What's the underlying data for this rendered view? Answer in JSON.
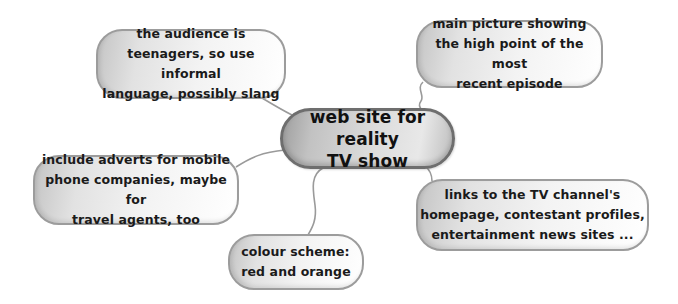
{
  "mindmap": {
    "center": {
      "label": "web site for reality\nTV show"
    },
    "branches": [
      {
        "id": "audience",
        "label": "the audience is\nteenagers, so use informal\nlanguage, possibly slang"
      },
      {
        "id": "picture",
        "label": "main picture showing\nthe high point of the most\nrecent episode"
      },
      {
        "id": "adverts",
        "label": "include adverts for mobile\nphone companies, maybe for\ntravel agents, too"
      },
      {
        "id": "links",
        "label": "links to the TV channel's\nhomepage, contestant profiles,\nentertainment news sites ..."
      },
      {
        "id": "colour",
        "label": "colour scheme:\nred and orange"
      }
    ]
  },
  "colors": {
    "node_border": "#9c9c9c",
    "center_border": "#6e6e6e",
    "connector": "#9a9a9a",
    "text": "#1a1a1a",
    "background": "#ffffff"
  }
}
